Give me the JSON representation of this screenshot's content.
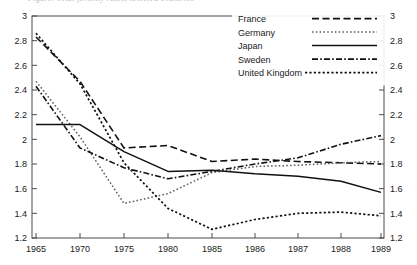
{
  "figure": {
    "clipped_caption": "Figure. Total fertility rates, selected countries",
    "background": "#ffffff",
    "line_color": "#111111"
  },
  "chart_data": {
    "type": "line",
    "title": "",
    "xlabel": "",
    "ylabel": "",
    "x": [
      "1965",
      "1970",
      "1975",
      "1980",
      "1985",
      "1986",
      "1987",
      "1988",
      "1989"
    ],
    "ylim": [
      1.2,
      3
    ],
    "yticks": [
      1.2,
      1.4,
      1.6,
      1.8,
      2,
      2.2,
      2.4,
      2.6,
      2.8,
      3
    ],
    "ytick_labels": [
      "1.2",
      "1.4",
      "1.6",
      "1.8",
      "2",
      "2.2",
      "2.4",
      "2.6",
      "2.8",
      "3"
    ],
    "xtick_labels": [
      "1965",
      "1970",
      "1975",
      "1980",
      "1985",
      "1986",
      "1987",
      "1988",
      "1989"
    ],
    "grid": false,
    "dual_y_axis": true,
    "legend_position": "top-right",
    "series": [
      {
        "name": "France",
        "style": "dashed",
        "values": [
          2.83,
          2.47,
          1.93,
          1.95,
          1.82,
          1.84,
          1.82,
          1.81,
          1.8
        ]
      },
      {
        "name": "Germany",
        "style": "dotted",
        "values": [
          2.47,
          2.02,
          1.48,
          1.56,
          1.73,
          1.78,
          1.79,
          1.81,
          1.82
        ]
      },
      {
        "name": "Japan",
        "style": "solid",
        "values": [
          2.12,
          2.12,
          1.9,
          1.74,
          1.75,
          1.72,
          1.7,
          1.66,
          1.57
        ]
      },
      {
        "name": "Sweden",
        "style": "dash-dot",
        "values": [
          2.43,
          1.93,
          1.77,
          1.68,
          1.74,
          1.8,
          1.85,
          1.96,
          2.03
        ]
      },
      {
        "name": "United Kingdom",
        "style": "fine-dotted",
        "values": [
          2.86,
          2.45,
          1.81,
          1.44,
          1.27,
          1.35,
          1.4,
          1.41,
          1.38
        ]
      }
    ]
  }
}
